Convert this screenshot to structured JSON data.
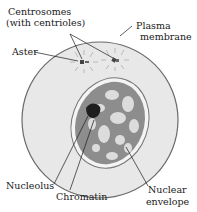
{
  "labels": {
    "centrosomes_line1": "Centrosomes",
    "centrosomes_line2": "(with centrioles)",
    "plasma_line1": "Plasma",
    "plasma_line2": "membrane",
    "aster": "Aster",
    "nucleolus": "Nucleolus",
    "chromatin": "Chromatin",
    "nuclear_line1": "Nuclear",
    "nuclear_line2": "envelope"
  },
  "colors": {
    "cytoplasm": "#e6e6e6",
    "membrane": "#6a6a6a",
    "nucleus_fill": "#8a8a8a",
    "nucleus_light": "#d8d8d8",
    "nucleolus": "#202020",
    "leader": "#1a1a1a"
  }
}
